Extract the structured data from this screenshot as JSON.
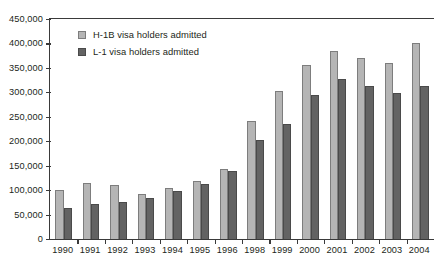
{
  "chart_data": {
    "type": "bar",
    "title": "",
    "subtitle": "",
    "xlabel": "",
    "ylabel": "",
    "ylim": [
      0,
      450000
    ],
    "ytick_labels": [
      "450,000",
      "400,000",
      "350,000",
      "300,000",
      "250,000",
      "200,000",
      "150,000",
      "100,000",
      "50,000",
      "0"
    ],
    "ytick_values": [
      450000,
      400000,
      350000,
      300000,
      250000,
      200000,
      150000,
      100000,
      50000,
      0
    ],
    "grid": false,
    "legend_position": "top-left",
    "categories": [
      "1990",
      "1991",
      "1992",
      "1993",
      "1994",
      "1995",
      "1996",
      "1998",
      "1999",
      "2000",
      "2001",
      "2002",
      "2003",
      "2004"
    ],
    "series": [
      {
        "name": "H-1B visa holders admitted",
        "color": "#b5b5b5",
        "values": [
          100000,
          115000,
          110000,
          93000,
          105000,
          118000,
          144000,
          241000,
          302000,
          355000,
          384000,
          370000,
          360000,
          400000
        ]
      },
      {
        "name": "L-1 visa holders admitted",
        "color": "#636363",
        "values": [
          64000,
          71000,
          75000,
          83000,
          98000,
          112000,
          140000,
          203000,
          235000,
          294000,
          328000,
          313000,
          298000,
          314000
        ]
      }
    ]
  },
  "legend": {
    "items": [
      {
        "label": "H-1B visa holders admitted",
        "swatch": "legend-swatch-h1b"
      },
      {
        "label": "L-1 visa holders admitted",
        "swatch": "legend-swatch-l1"
      }
    ]
  },
  "axes": {
    "y_axis_name": "y-axis",
    "x_axis_name": "x-axis"
  }
}
